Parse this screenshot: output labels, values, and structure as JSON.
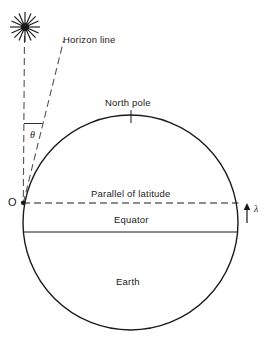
{
  "figure": {
    "background_color": "#ffffff",
    "stroke_color": "#1a1a1a",
    "width": 265,
    "height": 343
  },
  "labels": {
    "horizon_line": "Horizon line",
    "north_pole": "North pole",
    "parallel_of_latitude": "Parallel of latitude",
    "equator": "Equator",
    "earth": "Earth",
    "origin_point": "O",
    "angle_theta": "θ",
    "latitude_lambda": "λ"
  },
  "geometry": {
    "earth_circle": {
      "cx": 130.5,
      "cy": 222.5,
      "r": 107.5
    },
    "observer_point": {
      "x": 23,
      "y": 202.5
    },
    "star_position": {
      "x": 25,
      "y": 27
    },
    "north_pole_tick": {
      "x": 131,
      "y_top": 110,
      "y_bottom": 123
    },
    "equator_line_y": 232,
    "parallel_line_y": 203,
    "latitude_arrow": {
      "x": 247,
      "y_top": 205,
      "y_bottom": 223
    }
  },
  "elements": {
    "star_name": "star-burst",
    "vertical_dashed_name": "vertical-sight-line",
    "horizon_dashed_name": "horizon-line",
    "angle_tick_name": "angle-reference-tick"
  }
}
